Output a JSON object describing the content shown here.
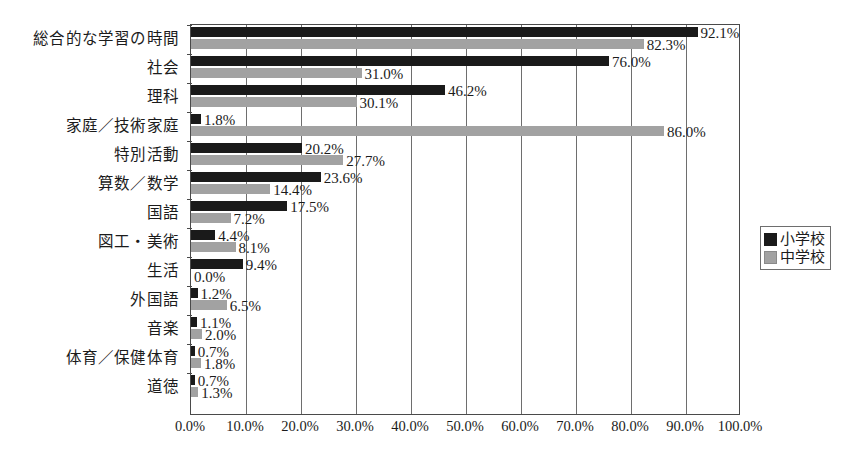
{
  "chart_data": {
    "type": "bar",
    "orientation": "horizontal",
    "title": "",
    "xlabel": "",
    "ylabel": "",
    "xlim": [
      0,
      100
    ],
    "grid": true,
    "legend_position": "right",
    "unit": "%",
    "categories": [
      "総合的な学習の時間",
      "社会",
      "理科",
      "家庭／技術家庭",
      "特別活動",
      "算数／数学",
      "国語",
      "図工・美術",
      "生活",
      "外国語",
      "音楽",
      "体育／保健体育",
      "道徳"
    ],
    "series": [
      {
        "name": "小学校",
        "color": "#1a1a1a",
        "values": [
          92.1,
          76.0,
          46.2,
          1.8,
          20.2,
          23.6,
          17.5,
          4.4,
          9.4,
          1.2,
          1.1,
          0.7,
          0.7
        ],
        "labels": [
          "92.1%",
          "76.0%",
          "46.2%",
          "1.8%",
          "20.2%",
          "23.6%",
          "17.5%",
          "4.4%",
          "9.4%",
          "1.2%",
          "1.1%",
          "0.7%",
          "0.7%"
        ]
      },
      {
        "name": "中学校",
        "color": "#a2a2a2",
        "values": [
          82.3,
          31.0,
          30.1,
          86.0,
          27.7,
          14.4,
          7.2,
          8.1,
          0.0,
          6.5,
          2.0,
          1.8,
          1.3
        ],
        "labels": [
          "82.3%",
          "31.0%",
          "30.1%",
          "86.0%",
          "27.7%",
          "14.4%",
          "7.2%",
          "8.1%",
          "0.0%",
          "6.5%",
          "2.0%",
          "1.8%",
          "1.3%"
        ]
      }
    ],
    "xticks": [
      0,
      10,
      20,
      30,
      40,
      50,
      60,
      70,
      80,
      90,
      100
    ],
    "xtick_labels": [
      "0.0%",
      "10.0%",
      "20.0%",
      "30.0%",
      "40.0%",
      "50.0%",
      "60.0%",
      "70.0%",
      "80.0%",
      "90.0%",
      "100.0%"
    ]
  },
  "legend": {
    "items": [
      {
        "label": "小学校"
      },
      {
        "label": "中学校"
      }
    ]
  }
}
